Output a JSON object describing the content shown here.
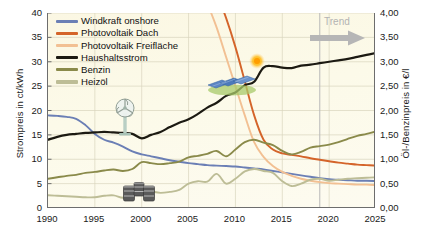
{
  "chart_data": {
    "type": "line",
    "title": "",
    "xlabel": "",
    "ylabel": "Strompreis in ct/kWh",
    "y2label": "Öl-/Benzinpreis in €/l",
    "xlim": [
      1990,
      2025
    ],
    "ylim": [
      0,
      40
    ],
    "y2lim": [
      0.0,
      4.0
    ],
    "grid": true,
    "legend_position": "top-left",
    "x_ticks": [
      "1990",
      "1995",
      "2000",
      "2005",
      "2010",
      "2015",
      "2020",
      "2025"
    ],
    "x_tick_values": [
      1990,
      1995,
      2000,
      2005,
      2010,
      2015,
      2020,
      2025
    ],
    "y_ticks": [
      "0",
      "5",
      "10",
      "15",
      "20",
      "25",
      "30",
      "35",
      "40"
    ],
    "y_tick_values": [
      0,
      5,
      10,
      15,
      20,
      25,
      30,
      35,
      40
    ],
    "y2_ticks": [
      "0,00",
      "0,50",
      "1,00",
      "1,50",
      "2,00",
      "2,50",
      "3,00",
      "3,50",
      "4,00"
    ],
    "y2_tick_values": [
      0.0,
      0.5,
      1.0,
      1.5,
      2.0,
      2.5,
      3.0,
      3.5,
      4.0
    ],
    "annotations": [
      {
        "name": "trend",
        "label": "Trend",
        "x": 2019,
        "icon": "right-arrow-icon",
        "color": "#b8b8b8"
      }
    ],
    "series": [
      {
        "name": "Windkraft onshore",
        "color": "#6b7fb5",
        "axis": "left",
        "x": [
          1990,
          1991,
          1992,
          1993,
          1994,
          1995,
          1996,
          1997,
          1998,
          1999,
          2000,
          2001,
          2002,
          2003,
          2004,
          2005,
          2006,
          2007,
          2008,
          2009,
          2010,
          2011,
          2012,
          2013,
          2014,
          2015,
          2016,
          2017,
          2018,
          2019,
          2020,
          2021,
          2022,
          2023,
          2024,
          2025
        ],
        "values": [
          19.0,
          18.9,
          18.7,
          18.3,
          17.0,
          15.2,
          14.0,
          13.4,
          12.6,
          11.6,
          11.0,
          10.6,
          10.2,
          9.8,
          9.5,
          9.2,
          9.0,
          8.8,
          8.7,
          8.6,
          8.5,
          8.3,
          8.1,
          7.9,
          7.6,
          7.3,
          7.0,
          6.7,
          6.4,
          6.1,
          5.9,
          5.8,
          5.7,
          5.6,
          5.6,
          5.5
        ]
      },
      {
        "name": "Photovoltaik Dach",
        "color": "#d4642a",
        "axis": "left",
        "x": [
          2006,
          2007,
          2008,
          2009,
          2010,
          2011,
          2012,
          2013,
          2014,
          2015,
          2016,
          2017,
          2018,
          2019,
          2020,
          2021,
          2022,
          2023,
          2024,
          2025
        ],
        "values": [
          54.0,
          49.0,
          44.0,
          39.0,
          33.0,
          26.0,
          19.0,
          14.0,
          12.0,
          11.2,
          10.9,
          10.6,
          10.2,
          9.9,
          9.6,
          9.3,
          9.1,
          8.9,
          8.8,
          8.7
        ]
      },
      {
        "name": "Photovoltaik Freifläche",
        "color": "#f2c093",
        "axis": "left",
        "x": [
          2006,
          2007,
          2008,
          2009,
          2010,
          2011,
          2012,
          2013,
          2014,
          2015,
          2016,
          2017,
          2018,
          2019,
          2020,
          2021,
          2022,
          2023,
          2024,
          2025
        ],
        "values": [
          47.0,
          42.0,
          37.0,
          31.0,
          25.0,
          19.0,
          13.5,
          10.5,
          8.6,
          7.4,
          6.6,
          6.0,
          5.6,
          5.3,
          5.1,
          5.0,
          4.9,
          4.8,
          4.8,
          4.7
        ]
      },
      {
        "name": "Haushaltsstrom",
        "color": "#1c1a12",
        "axis": "left",
        "x": [
          1990,
          1991,
          1992,
          1993,
          1994,
          1995,
          1996,
          1997,
          1998,
          1999,
          2000,
          2001,
          2002,
          2003,
          2004,
          2005,
          2006,
          2007,
          2008,
          2009,
          2010,
          2011,
          2012,
          2013,
          2014,
          2015,
          2016,
          2017,
          2018,
          2019,
          2020,
          2021,
          2022,
          2023,
          2024,
          2025
        ],
        "values": [
          14.0,
          14.6,
          15.0,
          15.2,
          15.4,
          15.5,
          15.6,
          15.5,
          15.4,
          15.2,
          14.3,
          15.0,
          15.6,
          16.6,
          17.5,
          18.2,
          19.3,
          20.6,
          21.6,
          23.0,
          23.7,
          25.2,
          25.9,
          28.8,
          29.1,
          28.8,
          28.7,
          29.2,
          29.4,
          29.7,
          30.0,
          30.3,
          30.6,
          31.0,
          31.4,
          31.8
        ]
      },
      {
        "name": "Benzin",
        "color": "#8a8a4a",
        "axis": "right",
        "x": [
          1990,
          1991,
          1992,
          1993,
          1994,
          1995,
          1996,
          1997,
          1998,
          1999,
          2000,
          2001,
          2002,
          2003,
          2004,
          2005,
          2006,
          2007,
          2008,
          2009,
          2010,
          2011,
          2012,
          2013,
          2014,
          2015,
          2016,
          2017,
          2018,
          2019,
          2020,
          2021,
          2022,
          2023,
          2024,
          2025
        ],
        "values": [
          0.6,
          0.63,
          0.66,
          0.68,
          0.72,
          0.74,
          0.77,
          0.79,
          0.76,
          0.8,
          0.94,
          0.92,
          0.9,
          0.92,
          0.95,
          1.04,
          1.07,
          1.11,
          1.17,
          1.06,
          1.2,
          1.35,
          1.4,
          1.34,
          1.29,
          1.17,
          1.1,
          1.15,
          1.24,
          1.27,
          1.3,
          1.35,
          1.42,
          1.48,
          1.52,
          1.57
        ]
      },
      {
        "name": "Heizöl",
        "color": "#bdbd96",
        "axis": "right",
        "x": [
          1990,
          1991,
          1992,
          1993,
          1994,
          1995,
          1996,
          1997,
          1998,
          1999,
          2000,
          2001,
          2002,
          2003,
          2004,
          2005,
          2006,
          2007,
          2008,
          2009,
          2010,
          2011,
          2012,
          2013,
          2014,
          2015,
          2016,
          2017,
          2018,
          2019,
          2020,
          2021,
          2022,
          2023,
          2024,
          2025
        ],
        "values": [
          0.26,
          0.25,
          0.24,
          0.23,
          0.22,
          0.22,
          0.25,
          0.26,
          0.21,
          0.24,
          0.37,
          0.34,
          0.31,
          0.33,
          0.37,
          0.5,
          0.55,
          0.54,
          0.7,
          0.5,
          0.6,
          0.75,
          0.8,
          0.76,
          0.72,
          0.55,
          0.45,
          0.5,
          0.58,
          0.6,
          0.56,
          0.58,
          0.6,
          0.61,
          0.62,
          0.63
        ]
      }
    ]
  },
  "legend": {
    "items": [
      {
        "label": "Windkraft onshore",
        "color": "#6b7fb5"
      },
      {
        "label": "Photovoltaik Dach",
        "color": "#d4642a"
      },
      {
        "label": "Photovoltaik Freifläche",
        "color": "#f2c093"
      },
      {
        "label": "Haushaltsstrom",
        "color": "#1c1a12"
      },
      {
        "label": "Benzin",
        "color": "#8a8a4a"
      },
      {
        "label": "Heizöl",
        "color": "#bdbd96"
      }
    ]
  },
  "icons": [
    {
      "name": "wind-turbine-icon"
    },
    {
      "name": "oil-barrels-icon"
    },
    {
      "name": "solar-panels-icon"
    },
    {
      "name": "sun-icon"
    }
  ]
}
